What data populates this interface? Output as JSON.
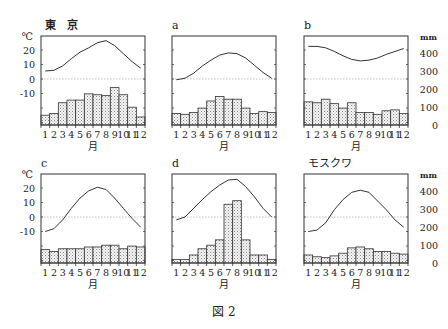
{
  "figure": {
    "caption": "図 2",
    "temp_unit": "℃",
    "precip_unit": "mm",
    "month_axis_label": "月",
    "month_ticks": [
      "1",
      "2",
      "3",
      "4",
      "5",
      "6",
      "7",
      "8",
      "9",
      "10",
      "11",
      "12"
    ],
    "temp_ticks": [
      20,
      10,
      0,
      -10
    ],
    "precip_ticks": [
      400,
      300,
      200,
      100,
      0
    ],
    "colors": {
      "line": "#333333",
      "bar_fill": "#e6e6e6",
      "bar_stroke": "#333333",
      "frame": "#333333",
      "zero_line": "#aaaaaa"
    }
  },
  "chart_data": [
    {
      "type": "bar+line",
      "title": "東　京",
      "xlabel": "月",
      "ylabel_left": "℃",
      "ylabel_right": "mm",
      "categories": [
        "1",
        "2",
        "3",
        "4",
        "5",
        "6",
        "7",
        "8",
        "9",
        "10",
        "11",
        "12"
      ],
      "series": [
        {
          "name": "気温 (℃)",
          "type": "line",
          "values": [
            5.5,
            6,
            9,
            14,
            18.5,
            21.5,
            25,
            26.5,
            23,
            17.5,
            12,
            7.5
          ]
        },
        {
          "name": "降水量 (mm)",
          "type": "bar",
          "values": [
            55,
            65,
            125,
            140,
            140,
            175,
            170,
            165,
            210,
            170,
            100,
            45
          ]
        }
      ],
      "temp_range": [
        -30,
        30
      ],
      "precip_range": [
        0,
        500
      ]
    },
    {
      "type": "bar+line",
      "title": "a",
      "xlabel": "月",
      "categories": [
        "1",
        "2",
        "3",
        "4",
        "5",
        "6",
        "7",
        "8",
        "9",
        "10",
        "11",
        "12"
      ],
      "series": [
        {
          "name": "気温 (℃)",
          "type": "line",
          "values": [
            -0.5,
            0.5,
            4,
            9,
            13,
            16.5,
            18,
            17.5,
            14.5,
            9.5,
            4.5,
            0.5
          ]
        },
        {
          "name": "降水量 (mm)",
          "type": "bar",
          "values": [
            65,
            60,
            70,
            95,
            135,
            160,
            145,
            145,
            95,
            65,
            75,
            70
          ]
        }
      ],
      "temp_range": [
        -30,
        30
      ],
      "precip_range": [
        0,
        500
      ]
    },
    {
      "type": "bar+line",
      "title": "b",
      "xlabel": "月",
      "categories": [
        "1",
        "2",
        "3",
        "4",
        "5",
        "6",
        "7",
        "8",
        "9",
        "10",
        "11",
        "12"
      ],
      "series": [
        {
          "name": "気温 (℃)",
          "type": "line",
          "values": [
            22.5,
            22.5,
            21.5,
            19,
            16,
            13.5,
            12.5,
            13,
            14.5,
            17,
            19,
            21
          ]
        },
        {
          "name": "降水量 (mm)",
          "type": "bar",
          "values": [
            130,
            125,
            145,
            120,
            95,
            125,
            70,
            70,
            60,
            80,
            85,
            65
          ]
        }
      ],
      "temp_range": [
        -30,
        30
      ],
      "precip_range": [
        0,
        500
      ]
    },
    {
      "type": "bar+line",
      "title": "c",
      "xlabel": "月",
      "categories": [
        "1",
        "2",
        "3",
        "4",
        "5",
        "6",
        "7",
        "8",
        "9",
        "10",
        "11",
        "12"
      ],
      "series": [
        {
          "name": "気温 (℃)",
          "type": "line",
          "values": [
            -10,
            -8,
            -2,
            6,
            13,
            18,
            20.5,
            19,
            13,
            6,
            -1,
            -7
          ]
        },
        {
          "name": "降水量 (mm)",
          "type": "bar",
          "values": [
            75,
            65,
            80,
            80,
            80,
            90,
            90,
            100,
            100,
            80,
            95,
            90
          ]
        }
      ],
      "temp_range": [
        -30,
        30
      ],
      "precip_range": [
        0,
        500
      ]
    },
    {
      "type": "bar+line",
      "title": "d",
      "xlabel": "月",
      "categories": [
        "1",
        "2",
        "3",
        "4",
        "5",
        "6",
        "7",
        "8",
        "9",
        "10",
        "11",
        "12"
      ],
      "series": [
        {
          "name": "気温 (℃)",
          "type": "line",
          "values": [
            -2,
            0,
            6,
            12,
            17.5,
            22,
            25.5,
            26,
            21,
            14,
            6,
            0
          ]
        },
        {
          "name": "降水量 (mm)",
          "type": "bar",
          "values": [
            20,
            20,
            45,
            80,
            100,
            130,
            330,
            350,
            130,
            45,
            45,
            20
          ]
        }
      ],
      "temp_range": [
        -30,
        30
      ],
      "precip_range": [
        0,
        500
      ]
    },
    {
      "type": "bar+line",
      "title": "モスクワ",
      "xlabel": "月",
      "categories": [
        "1",
        "2",
        "3",
        "4",
        "5",
        "6",
        "7",
        "8",
        "9",
        "10",
        "11",
        "12"
      ],
      "series": [
        {
          "name": "気温 (℃)",
          "type": "line",
          "values": [
            -10,
            -9,
            -4,
            5,
            12,
            17,
            18.5,
            17,
            11,
            5,
            -2,
            -7
          ]
        },
        {
          "name": "降水量 (mm)",
          "type": "bar",
          "values": [
            45,
            35,
            30,
            40,
            55,
            85,
            90,
            80,
            65,
            65,
            55,
            50
          ]
        }
      ],
      "temp_range": [
        -30,
        30
      ],
      "precip_range": [
        0,
        500
      ]
    }
  ]
}
